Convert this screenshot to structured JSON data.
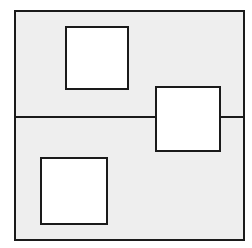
{
  "figure": {
    "canvas": {
      "width": 252,
      "height": 248,
      "background": "#ffffff"
    },
    "colors": {
      "stroke": "#1a1a1a",
      "region_fill": "#eeeeee",
      "square_fill": "#ffffff"
    },
    "stroke_width": 2,
    "outer_rectangle": {
      "label": "outer-rectangle",
      "x": 15,
      "y": 11,
      "width": 229,
      "height": 229,
      "fill": "#eeeeee",
      "stroke": "#1a1a1a"
    },
    "divider_line": {
      "label": "horizontal-divider",
      "x1": 15,
      "y1": 117,
      "x2": 244,
      "y2": 117,
      "stroke": "#1a1a1a"
    },
    "squares": [
      {
        "name": "top-square",
        "x": 66,
        "y": 27,
        "size": 62,
        "fill": "#ffffff",
        "stroke": "#1a1a1a"
      },
      {
        "name": "middle-right-square",
        "x": 156,
        "y": 87,
        "size": 64,
        "fill": "#ffffff",
        "stroke": "#1a1a1a"
      },
      {
        "name": "bottom-left-square",
        "x": 41,
        "y": 158,
        "size": 66,
        "fill": "#ffffff",
        "stroke": "#1a1a1a"
      }
    ]
  }
}
